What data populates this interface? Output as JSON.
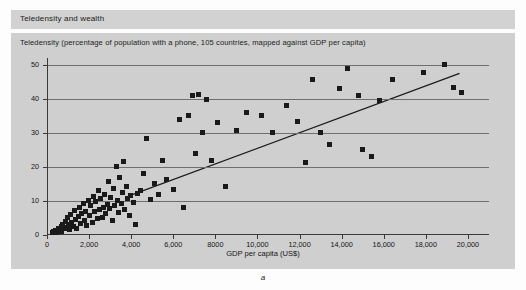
{
  "header": {
    "title": "Teledensity and wealth"
  },
  "figure": {
    "caption": "a"
  },
  "chart_data": {
    "type": "scatter",
    "title": "Teledensity (percentage of population with a phone, 105 countries, mapped against GDP per capita)",
    "xlabel": "GDP per capita (US$)",
    "ylabel": "",
    "xlim": [
      0,
      21000
    ],
    "ylim": [
      0,
      52
    ],
    "grid": true,
    "legend": false,
    "yticks": [
      0,
      10,
      20,
      30,
      40,
      50
    ],
    "ytick_labels": [
      "0",
      "10",
      "20",
      "30",
      "40",
      "50"
    ],
    "xticks": [
      0,
      2000,
      4000,
      6000,
      8000,
      10000,
      12000,
      14000,
      16000,
      18000,
      20000
    ],
    "xtick_labels": [
      "0",
      "2,000",
      "4,000",
      "6,000",
      "8000",
      "10,000",
      "12,000",
      "14,000",
      "16,000",
      "18,000",
      "20,000"
    ],
    "marker": "square",
    "marker_color": "#1a1a1a",
    "trendline": {
      "type": "linear",
      "x": [
        3900,
        19600
      ],
      "y": [
        11.5,
        47.5
      ],
      "color": "#1a1a1a"
    },
    "points": [
      [
        260,
        0.6
      ],
      [
        330,
        1.0
      ],
      [
        400,
        1.4
      ],
      [
        470,
        0.8
      ],
      [
        540,
        2.0
      ],
      [
        610,
        1.2
      ],
      [
        680,
        2.6
      ],
      [
        700,
        0.9
      ],
      [
        760,
        3.2
      ],
      [
        820,
        1.8
      ],
      [
        880,
        4.0
      ],
      [
        900,
        2.2
      ],
      [
        960,
        5.1
      ],
      [
        1000,
        3.0
      ],
      [
        1060,
        1.6
      ],
      [
        1120,
        6.0
      ],
      [
        1180,
        3.8
      ],
      [
        1240,
        2.4
      ],
      [
        1300,
        7.2
      ],
      [
        1360,
        4.6
      ],
      [
        1420,
        2.0
      ],
      [
        1480,
        5.4
      ],
      [
        1540,
        8.1
      ],
      [
        1600,
        3.4
      ],
      [
        1660,
        6.3
      ],
      [
        1720,
        9.2
      ],
      [
        1780,
        4.2
      ],
      [
        1840,
        7.0
      ],
      [
        1900,
        2.8
      ],
      [
        1960,
        10.0
      ],
      [
        2020,
        5.8
      ],
      [
        2080,
        8.6
      ],
      [
        2140,
        3.6
      ],
      [
        2200,
        11.2
      ],
      [
        2260,
        6.8
      ],
      [
        2320,
        9.8
      ],
      [
        2380,
        4.8
      ],
      [
        2440,
        13.0
      ],
      [
        2500,
        7.6
      ],
      [
        2560,
        10.6
      ],
      [
        2620,
        5.2
      ],
      [
        2680,
        8.2
      ],
      [
        2740,
        12.0
      ],
      [
        2800,
        6.4
      ],
      [
        2860,
        9.0
      ],
      [
        2920,
        15.8
      ],
      [
        2980,
        7.8
      ],
      [
        3040,
        11.0
      ],
      [
        3100,
        4.4
      ],
      [
        3160,
        13.6
      ],
      [
        3220,
        8.8
      ],
      [
        3280,
        20.0
      ],
      [
        3340,
        10.2
      ],
      [
        3400,
        6.6
      ],
      [
        3460,
        17.0
      ],
      [
        3520,
        9.4
      ],
      [
        3580,
        12.6
      ],
      [
        3640,
        21.6
      ],
      [
        3700,
        7.4
      ],
      [
        3760,
        14.2
      ],
      [
        3820,
        10.8
      ],
      [
        3900,
        5.6
      ],
      [
        3980,
        11.6
      ],
      [
        4100,
        9.6
      ],
      [
        4200,
        3.2
      ],
      [
        4320,
        12.2
      ],
      [
        4450,
        13.2
      ],
      [
        4600,
        18.0
      ],
      [
        4750,
        28.4
      ],
      [
        4900,
        10.4
      ],
      [
        5100,
        15.0
      ],
      [
        5300,
        11.8
      ],
      [
        5500,
        22.0
      ],
      [
        5700,
        16.4
      ],
      [
        6000,
        13.4
      ],
      [
        6300,
        33.8
      ],
      [
        6500,
        8.0
      ],
      [
        6700,
        35.0
      ],
      [
        6900,
        41.0
      ],
      [
        7050,
        24.0
      ],
      [
        7200,
        41.4
      ],
      [
        7400,
        30.0
      ],
      [
        7600,
        39.8
      ],
      [
        7800,
        21.8
      ],
      [
        8100,
        33.0
      ],
      [
        8500,
        14.2
      ],
      [
        9000,
        30.6
      ],
      [
        9500,
        36.0
      ],
      [
        10200,
        35.0
      ],
      [
        10700,
        30.2
      ],
      [
        11400,
        38.0
      ],
      [
        11900,
        33.4
      ],
      [
        12300,
        21.4
      ],
      [
        12600,
        45.6
      ],
      [
        13000,
        30.0
      ],
      [
        13400,
        26.6
      ],
      [
        13900,
        43.0
      ],
      [
        14300,
        49.0
      ],
      [
        14800,
        41.0
      ],
      [
        15000,
        25.2
      ],
      [
        15400,
        23.2
      ],
      [
        15800,
        39.4
      ],
      [
        16400,
        45.6
      ],
      [
        17900,
        47.6
      ],
      [
        18900,
        50.0
      ],
      [
        19300,
        43.4
      ],
      [
        19700,
        41.8
      ]
    ]
  }
}
